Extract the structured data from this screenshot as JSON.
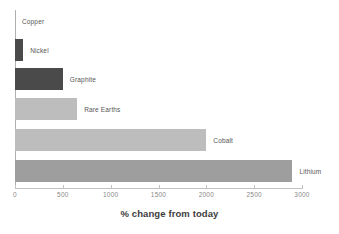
{
  "chart_data": {
    "type": "bar",
    "orientation": "horizontal",
    "title": "",
    "xlabel": "% change from today",
    "ylabel": "",
    "categories": [
      "Copper",
      "Nickel",
      "Graphite",
      "Rare Earths",
      "Cobalt",
      "Lithium"
    ],
    "values": [
      0,
      85,
      500,
      650,
      2000,
      2900
    ],
    "xlim": [
      0,
      3000
    ],
    "xticks": [
      0,
      500,
      1000,
      1500,
      2000,
      2500,
      3000
    ],
    "xtick_labels": [
      "0",
      "500",
      "1000",
      "1500",
      "2000",
      "2500",
      "3000"
    ],
    "grid": false,
    "legend": false,
    "bar_colors": [
      "#4a4a4a",
      "#4a4a4a",
      "#4a4a4a",
      "#bdbdbd",
      "#bdbdbd",
      "#9e9e9e"
    ],
    "label_color": "#555555",
    "axis_color": "#c2c2c2",
    "series": [
      {
        "name": "% change from today",
        "values": [
          0,
          85,
          500,
          650,
          2000,
          2900
        ]
      }
    ],
    "bars": [
      {
        "category": "Copper",
        "value": 0,
        "color": "#9e9e9e",
        "label": "Copper"
      },
      {
        "category": "Nickel",
        "value": 85,
        "color": "#4a4a4a",
        "label": "Nickel"
      },
      {
        "category": "Graphite",
        "value": 500,
        "color": "#4a4a4a",
        "label": "Graphite"
      },
      {
        "category": "Rare Earths",
        "value": 650,
        "color": "#bdbdbd",
        "label": "Rare Earths"
      },
      {
        "category": "Cobalt",
        "value": 2000,
        "color": "#bdbdbd",
        "label": "Cobalt"
      },
      {
        "category": "Lithium",
        "value": 2900,
        "color": "#9e9e9e",
        "label": "Lithium"
      }
    ]
  }
}
